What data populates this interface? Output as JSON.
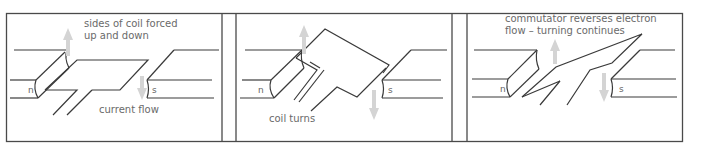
{
  "figure": {
    "panels": [
      {
        "id": "panel-1",
        "labels": {
          "force": "sides of coil forced",
          "force_line2": "up and down",
          "current": "current flow",
          "north": "n",
          "south": "s"
        }
      },
      {
        "id": "panel-2",
        "labels": {
          "caption": "coil turns",
          "north": "n",
          "south": "s"
        }
      },
      {
        "id": "panel-3",
        "labels": {
          "caption": "commutator reverses electron",
          "caption_line2": "flow – turning continues",
          "north": "n",
          "south": "s"
        }
      }
    ],
    "colors": {
      "line": "#3a3a3a",
      "arrow": "#d4d4d4",
      "text": "#6a6a6a"
    }
  }
}
